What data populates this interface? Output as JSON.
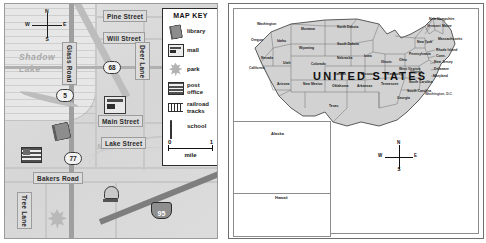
{
  "town_map": {
    "name": "town-street-map",
    "lake_label": "Shadow\nLake",
    "lake_line1": "Shadow",
    "lake_line2": "Lake",
    "river_label": "Mill River",
    "compass": {
      "n": "N",
      "s": "S",
      "e": "E",
      "w": "W"
    },
    "streets": [
      {
        "label": "Pine Street",
        "orientation": "horizontal"
      },
      {
        "label": "Will Street",
        "orientation": "horizontal"
      },
      {
        "label": "Main Street",
        "orientation": "horizontal"
      },
      {
        "label": "Lake Street",
        "orientation": "horizontal"
      },
      {
        "label": "Bakers Road",
        "orientation": "horizontal"
      },
      {
        "label": "Glass Road",
        "orientation": "vertical"
      },
      {
        "label": "Deer Lane",
        "orientation": "vertical"
      },
      {
        "label": "Tree Lane",
        "orientation": "vertical"
      }
    ],
    "routes": [
      {
        "number": "5",
        "type": "state"
      },
      {
        "number": "68",
        "type": "state"
      },
      {
        "number": "77",
        "type": "state"
      },
      {
        "number": "95",
        "type": "interstate"
      }
    ],
    "placed_icons": [
      {
        "icon": "book-icon",
        "meaning": "library"
      },
      {
        "icon": "mall-icon",
        "meaning": "mall"
      },
      {
        "icon": "post-office-icon",
        "meaning": "post office"
      },
      {
        "icon": "bell-icon",
        "meaning": "school"
      },
      {
        "icon": "leaf-icon",
        "meaning": "park"
      }
    ]
  },
  "map_key": {
    "title": "MAP KEY",
    "entries": [
      {
        "icon": "book-icon",
        "label": "library"
      },
      {
        "icon": "mall-icon",
        "label": "mall"
      },
      {
        "icon": "leaf-icon",
        "label": "park"
      },
      {
        "icon": "post-office-icon",
        "label": "post\noffice",
        "line1": "post",
        "line2": "office"
      },
      {
        "icon": "railroad-tracks-icon",
        "label": "railroad\ntracks",
        "line1": "railroad",
        "line2": "tracks"
      },
      {
        "icon": "bell-icon",
        "label": "school"
      }
    ],
    "scale": {
      "min": "0",
      "max": "1",
      "unit": "mile"
    }
  },
  "us_map": {
    "title": "UNITED STATES",
    "capital_label": "Washington, D.C.",
    "compass": {
      "n": "N",
      "s": "S",
      "e": "E",
      "w": "W"
    },
    "insets": [
      {
        "name": "Alaska",
        "label": "Alaska"
      },
      {
        "name": "Hawaii",
        "label": "Hawaii"
      }
    ],
    "states": [
      {
        "name": "Washington",
        "x": 28,
        "y": 18
      },
      {
        "name": "Oregon",
        "x": 22,
        "y": 34
      },
      {
        "name": "Idaho",
        "x": 48,
        "y": 35
      },
      {
        "name": "Montana",
        "x": 72,
        "y": 23
      },
      {
        "name": "North Dakota",
        "x": 108,
        "y": 21
      },
      {
        "name": "South Dakota",
        "x": 108,
        "y": 38
      },
      {
        "name": "Wyoming",
        "x": 70,
        "y": 42
      },
      {
        "name": "Nevada",
        "x": 32,
        "y": 52
      },
      {
        "name": "Utah",
        "x": 54,
        "y": 57
      },
      {
        "name": "Colorado",
        "x": 82,
        "y": 58
      },
      {
        "name": "Nebraska",
        "x": 108,
        "y": 52
      },
      {
        "name": "Iowa",
        "x": 135,
        "y": 50
      },
      {
        "name": "Illinois",
        "x": 152,
        "y": 56
      },
      {
        "name": "California",
        "x": 20,
        "y": 62
      },
      {
        "name": "Arizona",
        "x": 48,
        "y": 78
      },
      {
        "name": "New Mexico",
        "x": 74,
        "y": 78
      },
      {
        "name": "Kansas",
        "x": 105,
        "y": 68
      },
      {
        "name": "Missouri",
        "x": 132,
        "y": 68
      },
      {
        "name": "Oklahoma",
        "x": 103,
        "y": 80
      },
      {
        "name": "Arkansas",
        "x": 128,
        "y": 80
      },
      {
        "name": "Texas",
        "x": 100,
        "y": 100
      },
      {
        "name": "Tennessee",
        "x": 152,
        "y": 78
      },
      {
        "name": "Kentucky",
        "x": 158,
        "y": 68
      },
      {
        "name": "Ohio",
        "x": 170,
        "y": 54
      },
      {
        "name": "West Virginia",
        "x": 170,
        "y": 63
      },
      {
        "name": "Virginia",
        "x": 181,
        "y": 66
      },
      {
        "name": "North Carolina",
        "x": 180,
        "y": 76
      },
      {
        "name": "South Carolina",
        "x": 178,
        "y": 85
      },
      {
        "name": "Georgia",
        "x": 168,
        "y": 92
      },
      {
        "name": "Pennsylvania",
        "x": 180,
        "y": 48
      },
      {
        "name": "New York",
        "x": 188,
        "y": 36
      },
      {
        "name": "Maine",
        "x": 213,
        "y": 20
      },
      {
        "name": "New Hampshire",
        "x": 200,
        "y": 13
      },
      {
        "name": "Vermont",
        "x": 198,
        "y": 20
      },
      {
        "name": "Massachusetts",
        "x": 209,
        "y": 33
      },
      {
        "name": "Rhode Island",
        "x": 207,
        "y": 44
      },
      {
        "name": "Conn.",
        "x": 207,
        "y": 50
      },
      {
        "name": "New Jersey",
        "x": 205,
        "y": 56
      },
      {
        "name": "Delaware",
        "x": 205,
        "y": 63
      },
      {
        "name": "Maryland",
        "x": 204,
        "y": 70
      }
    ]
  }
}
